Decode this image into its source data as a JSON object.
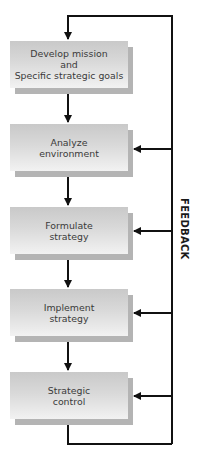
{
  "diagram": {
    "type": "flowchart",
    "steps": [
      {
        "label": "Develop mission\nand\nSpecific strategic goals"
      },
      {
        "label": "Analyze\nenvironment"
      },
      {
        "label": "Formulate\nstrategy"
      },
      {
        "label": "Implement\nstrategy"
      },
      {
        "label": "Strategic\ncontrol"
      }
    ],
    "feedback_label": "FEEDBACK",
    "colors": {
      "box_top": "#c9c9c9",
      "box_bottom": "#f2f2f2",
      "shadow": "#b4b4b4",
      "line": "#111111"
    }
  }
}
